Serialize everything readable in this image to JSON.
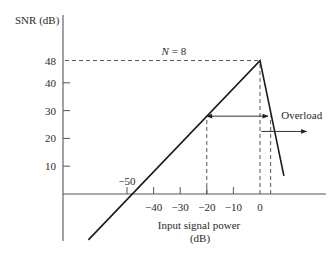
{
  "chart_data": {
    "type": "line",
    "title": "",
    "xlabel": [
      "Input signal power",
      "(dB)"
    ],
    "ylabel": "SNR (dB)",
    "xlim": [
      -65,
      25
    ],
    "ylim": [
      -17,
      48
    ],
    "x_ticks": [
      {
        "value": -40,
        "label": "−40"
      },
      {
        "value": -30,
        "label": "−30"
      },
      {
        "value": -20,
        "label": "−20"
      },
      {
        "value": -10,
        "label": "−10"
      },
      {
        "value": 0,
        "label": "0"
      }
    ],
    "x_tick_above": {
      "value": -50,
      "label": "−50"
    },
    "y_ticks": [
      {
        "value": 10,
        "label": "10"
      },
      {
        "value": 20,
        "label": "20"
      },
      {
        "value": 30,
        "label": "30"
      },
      {
        "value": 40,
        "label": "40"
      },
      {
        "value": 48,
        "label": "48"
      }
    ],
    "grid": false,
    "series": [
      {
        "name": "SNR vs input power (N = 8)",
        "points": [
          [
            -64.5,
            -16.5
          ],
          [
            0,
            48
          ],
          [
            9,
            6.5
          ]
        ]
      }
    ],
    "guides": {
      "peak_hline": {
        "y": 48,
        "from_x": -73,
        "to_x": 0
      },
      "vlines": [
        {
          "x": -20,
          "from_y": 0,
          "to_y": 28
        },
        {
          "x": 0,
          "from_y": 0,
          "to_y": 48
        },
        {
          "x": 4,
          "from_y": 0,
          "to_y": 28
        }
      ]
    },
    "annotations": [
      {
        "text": "N = 8",
        "x": -37,
        "y": 50
      },
      {
        "text": "Overload",
        "x": 8,
        "y": 27
      }
    ],
    "arrows": [
      {
        "name": "dynamic-range-arrow",
        "double": true,
        "from": [
          -20,
          28
        ],
        "to": [
          3,
          28
        ]
      },
      {
        "name": "overload-arrow",
        "double": false,
        "from": [
          0.5,
          22.5
        ],
        "to": [
          17.5,
          22.5
        ]
      }
    ]
  }
}
